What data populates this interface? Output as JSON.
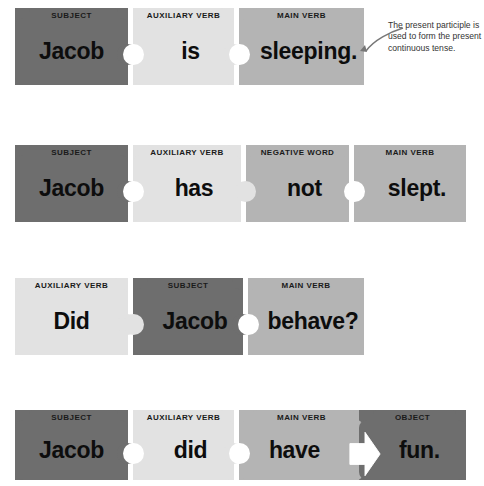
{
  "diagram": {
    "background_color": "#ffffff",
    "colors": {
      "dark_gray": "#6e6e6e",
      "medium_gray": "#b4b4b4",
      "light_gray": "#e2e2e2",
      "label_text": "#1a1a1a",
      "word_text": "#0d0d0d",
      "annotation_text": "#333333"
    },
    "rows": [
      {
        "id": "row-1",
        "sentence": "Jacob is sleeping.",
        "pieces": [
          {
            "label": "SUBJECT",
            "word": "Jacob",
            "color": "dark_gray"
          },
          {
            "label": "AUXILIARY VERB",
            "word": "is",
            "color": "light_gray"
          },
          {
            "label": "MAIN VERB",
            "word": "sleeping.",
            "color": "medium_gray"
          }
        ]
      },
      {
        "id": "row-2",
        "sentence": "Jacob has not slept.",
        "pieces": [
          {
            "label": "SUBJECT",
            "word": "Jacob",
            "color": "dark_gray"
          },
          {
            "label": "AUXILIARY VERB",
            "word": "has",
            "color": "light_gray"
          },
          {
            "label": "NEGATIVE WORD",
            "word": "not",
            "color": "medium_gray"
          },
          {
            "label": "MAIN VERB",
            "word": "slept.",
            "color": "medium_gray"
          }
        ]
      },
      {
        "id": "row-3",
        "sentence": "Did Jacob behave?",
        "pieces": [
          {
            "label": "AUXILIARY VERB",
            "word": "Did",
            "color": "light_gray"
          },
          {
            "label": "SUBJECT",
            "word": "Jacob",
            "color": "dark_gray"
          },
          {
            "label": "MAIN VERB",
            "word": "behave?",
            "color": "medium_gray"
          }
        ]
      },
      {
        "id": "row-4",
        "sentence": "Jacob did have fun.",
        "pieces": [
          {
            "label": "SUBJECT",
            "word": "Jacob",
            "color": "dark_gray"
          },
          {
            "label": "AUXILIARY VERB",
            "word": "did",
            "color": "light_gray"
          },
          {
            "label": "MAIN VERB",
            "word": "have",
            "color": "medium_gray"
          },
          {
            "label": "OBJECT",
            "word": "fun.",
            "color": "dark_gray"
          }
        ]
      }
    ],
    "annotation": {
      "text": "The present participle is used to form the present continuous tense.",
      "points_to": "sleeping."
    }
  }
}
